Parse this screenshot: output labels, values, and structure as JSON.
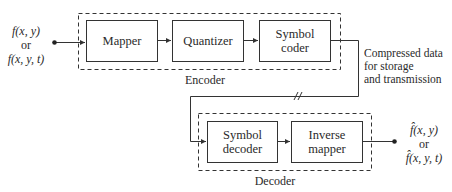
{
  "input": {
    "line1": "f(x, y)",
    "line2": "or",
    "line3": "f(x, y, t)"
  },
  "encoder": {
    "label": "Encoder",
    "blocks": [
      {
        "label": "Mapper"
      },
      {
        "label": "Quantizer"
      },
      {
        "label_line1": "Symbol",
        "label_line2": "coder"
      }
    ]
  },
  "channel": {
    "line1": "Compressed data",
    "line2": "for storage",
    "line3": "and transmission"
  },
  "decoder": {
    "label": "Decoder",
    "blocks": [
      {
        "label_line1": "Symbol",
        "label_line2": "decoder"
      },
      {
        "label_line1": "Inverse",
        "label_line2": "mapper"
      }
    ]
  },
  "output": {
    "line1": "f̂(x, y)",
    "line2": "or",
    "line3": "f̂(x, y, t)"
  },
  "colors": {
    "stroke": "#333333",
    "text": "#2a2a2a"
  }
}
